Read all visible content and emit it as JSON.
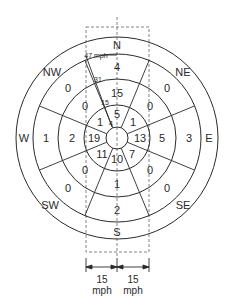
{
  "diagram": {
    "type": "wind-rose",
    "directions": {
      "N": "N",
      "NE": "NE",
      "E": "E",
      "SE": "SE",
      "S": "S",
      "SW": "SW",
      "W": "W",
      "NW": "NW"
    },
    "rings": {
      "inner": {
        "N": "5",
        "NE": "1",
        "E": "13",
        "SE": "7",
        "S": "10",
        "SW": "11",
        "W": "19",
        "NW": "1"
      },
      "second": {
        "N": "15",
        "NE": "0",
        "E": "5",
        "SE": "0",
        "S": "1",
        "SW": "0",
        "W": "2",
        "NW": "0"
      },
      "third": {
        "N": "4",
        "NE": "0",
        "E": "3",
        "SE": "0",
        "S": "2",
        "SW": "0",
        "W": "1",
        "NW": "0"
      }
    },
    "scale_labels": {
      "r1": "4",
      "r2": "15",
      "r3": "31",
      "r4": "47 mph"
    },
    "dimension": {
      "left_value": "15",
      "left_unit": "mph",
      "right_value": "15",
      "right_unit": "mph"
    },
    "colors": {
      "line": "#2a2a2a",
      "dash": "#555555",
      "background": "#ffffff"
    }
  }
}
